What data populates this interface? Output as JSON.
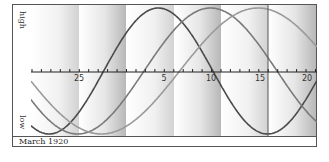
{
  "chart_data": {
    "type": "line",
    "title": "",
    "footer_label": "March 1920",
    "ylabel_top": "high",
    "ylabel_bottom": "low",
    "xlabel": "",
    "x_tick_labels": [
      "25",
      "5",
      "10",
      "15",
      "20"
    ],
    "x_tick_positions_day_offset": [
      4,
      13,
      18,
      23,
      28
    ],
    "x_range_days": [
      -0.4,
      29.6
    ],
    "ylim": [
      -1,
      1
    ],
    "grid": false,
    "bands": "alternating shaded weekly bands",
    "today_marker_day_offset": 24,
    "series": [
      {
        "name": "cycle-dark",
        "period_days": 23,
        "peak_day_offset": 13,
        "color": "#4a4a4a"
      },
      {
        "name": "cycle-medium",
        "period_days": 28,
        "peak_day_offset": 18.5,
        "color": "#7a7a7a"
      },
      {
        "name": "cycle-light",
        "period_days": 33,
        "peak_day_offset": 23.5,
        "color": "#9a9a9a"
      }
    ]
  },
  "labels": {
    "high": "high",
    "low": "low",
    "footer": "March 1920",
    "ticks": [
      {
        "label": "25",
        "x": 48
      },
      {
        "label": "5",
        "x": 133
      },
      {
        "label": "10",
        "x": 180
      },
      {
        "label": "15",
        "x": 229
      },
      {
        "label": "20",
        "x": 276
      }
    ]
  }
}
